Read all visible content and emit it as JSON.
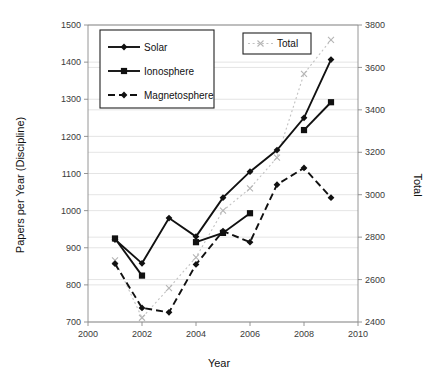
{
  "chart_data": {
    "type": "line",
    "title": "",
    "xlabel": "Year",
    "ylabel": "Papers per Year (Discipline)",
    "y2label": "Total",
    "xlim": [
      2000,
      2010
    ],
    "ylim": [
      700,
      1500
    ],
    "y2lim": [
      2400,
      3800
    ],
    "xticks": [
      2000,
      2002,
      2004,
      2006,
      2008,
      2010
    ],
    "yticks": [
      700,
      800,
      900,
      1000,
      1100,
      1200,
      1300,
      1400,
      1500
    ],
    "y2ticks": [
      2400,
      2600,
      2800,
      3000,
      3200,
      3400,
      3600,
      3800
    ],
    "grid": true,
    "legend_position": "upper-left",
    "x": [
      2001,
      2002,
      2003,
      2004,
      2005,
      2006,
      2007,
      2008,
      2009
    ],
    "series": [
      {
        "name": "Solar",
        "axis": "left",
        "line": "solid",
        "marker": "diamond",
        "color": "#111111",
        "values": [
          922,
          858,
          980,
          930,
          1035,
          1105,
          1163,
          1250,
          1407
        ]
      },
      {
        "name": "Ionosphere",
        "axis": "left",
        "line": "solid",
        "marker": "square",
        "color": "#111111",
        "values": [
          925,
          825,
          null,
          915,
          940,
          993,
          null,
          1217,
          1292
        ]
      },
      {
        "name": "Magnetosphere",
        "axis": "left",
        "line": "dashed",
        "marker": "diamond",
        "color": "#111111",
        "values": [
          857,
          738,
          726,
          855,
          945,
          915,
          1070,
          1115,
          1035
        ]
      },
      {
        "name": "Total",
        "axis": "right",
        "line": "dotted",
        "marker": "cross",
        "color": "#c2c2c2",
        "values": [
          2690,
          2420,
          2560,
          2705,
          2925,
          3030,
          3175,
          3570,
          3730
        ]
      }
    ]
  },
  "legend": {
    "main_entries": [
      "Solar",
      "Ionosphere",
      "Magnetosphere"
    ],
    "total_entry": "Total"
  },
  "axis_titles": {
    "x": "Year",
    "y_left": "Papers per Year (Discipline)",
    "y_right": "Total"
  }
}
